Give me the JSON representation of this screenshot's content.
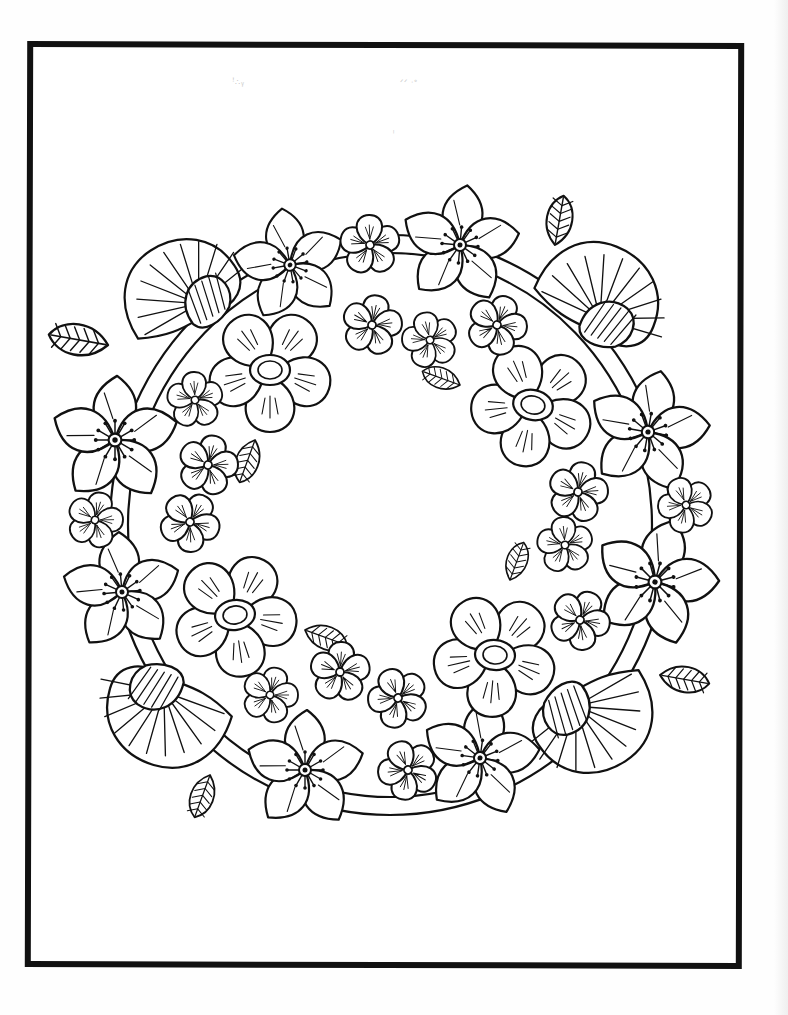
{
  "page": {
    "background": "#ffffff",
    "line_color": "#111111",
    "scan_marks": [
      "ꜝ∴ᵧ",
      "ᐟᐟ ᐧᐤ",
      "ᵎ"
    ]
  },
  "frame": {
    "x": 26,
    "y": 42,
    "width": 717,
    "height": 926,
    "stroke": 6
  },
  "wreath": {
    "center": [
      390,
      525
    ],
    "star_flowers": [
      {
        "x": 290,
        "y": 265,
        "r": 55,
        "rot": -10
      },
      {
        "x": 460,
        "y": 245,
        "r": 58,
        "rot": 5
      },
      {
        "x": 115,
        "y": 440,
        "r": 62,
        "rot": 0
      },
      {
        "x": 648,
        "y": 432,
        "r": 60,
        "rot": 10
      },
      {
        "x": 122,
        "y": 592,
        "r": 58,
        "rot": -5
      },
      {
        "x": 655,
        "y": 582,
        "r": 62,
        "rot": 15
      },
      {
        "x": 305,
        "y": 770,
        "r": 58,
        "rot": 0
      },
      {
        "x": 480,
        "y": 758,
        "r": 58,
        "rot": 8
      }
    ],
    "round_flowers": [
      {
        "x": 270,
        "y": 370,
        "r": 60,
        "rot": 0
      },
      {
        "x": 533,
        "y": 405,
        "r": 60,
        "rot": 12
      },
      {
        "x": 235,
        "y": 615,
        "r": 60,
        "rot": -8
      },
      {
        "x": 495,
        "y": 655,
        "r": 60,
        "rot": 5
      }
    ],
    "fan_flowers": [
      {
        "x": 185,
        "y": 300,
        "r": 60,
        "rot": -30
      },
      {
        "x": 595,
        "y": 305,
        "r": 62,
        "rot": 25
      },
      {
        "x": 170,
        "y": 705,
        "r": 62,
        "rot": 200
      },
      {
        "x": 590,
        "y": 710,
        "r": 62,
        "rot": 150
      }
    ],
    "small_flowers": [
      {
        "x": 370,
        "y": 245,
        "r": 30
      },
      {
        "x": 372,
        "y": 325,
        "r": 30
      },
      {
        "x": 430,
        "y": 340,
        "r": 28
      },
      {
        "x": 497,
        "y": 325,
        "r": 30
      },
      {
        "x": 195,
        "y": 400,
        "r": 28
      },
      {
        "x": 208,
        "y": 465,
        "r": 30
      },
      {
        "x": 95,
        "y": 520,
        "r": 28
      },
      {
        "x": 190,
        "y": 522,
        "r": 30
      },
      {
        "x": 578,
        "y": 492,
        "r": 30
      },
      {
        "x": 686,
        "y": 505,
        "r": 28
      },
      {
        "x": 565,
        "y": 545,
        "r": 28
      },
      {
        "x": 580,
        "y": 620,
        "r": 30
      },
      {
        "x": 340,
        "y": 672,
        "r": 30
      },
      {
        "x": 270,
        "y": 695,
        "r": 28
      },
      {
        "x": 398,
        "y": 698,
        "r": 30
      },
      {
        "x": 408,
        "y": 770,
        "r": 30
      }
    ],
    "leaves": [
      {
        "x": 108,
        "y": 345,
        "len": 60,
        "rot": 190
      },
      {
        "x": 555,
        "y": 245,
        "len": 50,
        "rot": 280
      },
      {
        "x": 255,
        "y": 440,
        "len": 45,
        "rot": 110
      },
      {
        "x": 460,
        "y": 385,
        "len": 40,
        "rot": 200
      },
      {
        "x": 510,
        "y": 580,
        "len": 40,
        "rot": 290
      },
      {
        "x": 305,
        "y": 630,
        "len": 45,
        "rot": 20
      },
      {
        "x": 660,
        "y": 675,
        "len": 50,
        "rot": 10
      },
      {
        "x": 210,
        "y": 775,
        "len": 45,
        "rot": 110
      }
    ]
  }
}
